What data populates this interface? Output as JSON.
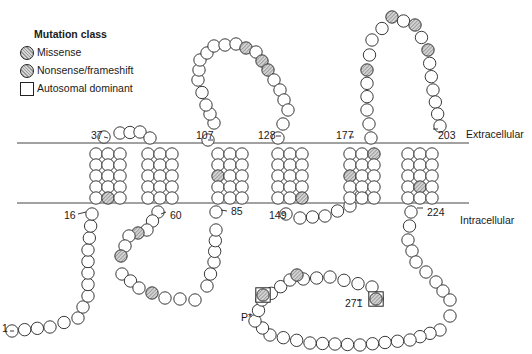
{
  "legend": {
    "title": "Mutation class",
    "items": [
      {
        "label": "Missense",
        "symbol": "hatched-circle"
      },
      {
        "label": "Nonsense/frameshift",
        "symbol": "hatched-circle"
      },
      {
        "label": "Autosomal dominant",
        "symbol": "open-square"
      }
    ]
  },
  "regions": {
    "extracellular": "Extracellular",
    "intracellular": "Intracellular"
  },
  "residue_labels": [
    {
      "text": "1",
      "x": 2,
      "y": 322
    },
    {
      "text": "16",
      "x": 64,
      "y": 209
    },
    {
      "text": "37",
      "x": 91,
      "y": 129
    },
    {
      "text": "60",
      "x": 170,
      "y": 209
    },
    {
      "text": "85",
      "x": 231,
      "y": 205
    },
    {
      "text": "107",
      "x": 196,
      "y": 129
    },
    {
      "text": "128",
      "x": 258,
      "y": 129
    },
    {
      "text": "149",
      "x": 269,
      "y": 209
    },
    {
      "text": "177",
      "x": 336,
      "y": 129
    },
    {
      "text": "203",
      "x": 438,
      "y": 129
    },
    {
      "text": "224",
      "x": 427,
      "y": 206
    },
    {
      "text": "271",
      "x": 345,
      "y": 297
    },
    {
      "text": "P*",
      "x": 241,
      "y": 311
    }
  ],
  "membrane": {
    "x1": 17,
    "x2": 469,
    "y_top": 143,
    "y_bottom": 203
  },
  "colors": {
    "stroke": "#222222",
    "hatch_dark": "#9a9a9a",
    "hatch_light": "#d6d6d6",
    "bead_fill": "#ffffff"
  }
}
